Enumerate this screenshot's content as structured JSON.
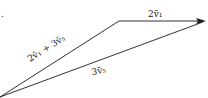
{
  "diagram": {
    "type": "vector-addition",
    "stray_mark": ".",
    "vectors": [
      {
        "id": "sum",
        "label": "2v⃗₁ + 3v⃗₅",
        "from": [
          0,
          97
        ],
        "to": [
          119,
          21
        ]
      },
      {
        "id": "v1",
        "label": "2v⃗₁",
        "from": [
          119,
          21
        ],
        "to": [
          205,
          21
        ],
        "arrow": true
      },
      {
        "id": "v5",
        "label": "3v⃗₅",
        "from": [
          0,
          97
        ],
        "to": [
          205,
          21
        ]
      }
    ],
    "labels": {
      "sum": "2v̄₁ + 3v̄₅",
      "v1": "2v̄₁",
      "v5": "3v̄₅"
    },
    "colors": {
      "line": "#1a1a1a",
      "background": "#ffffff"
    }
  }
}
